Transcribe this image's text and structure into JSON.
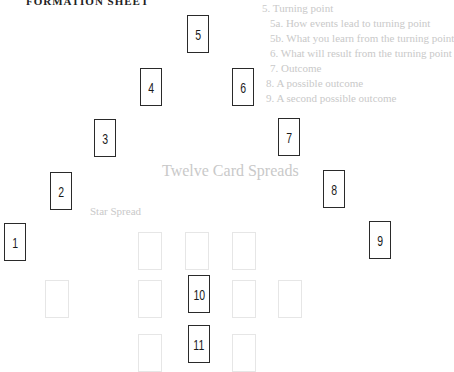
{
  "header": {
    "title": "FORMATION SHEET"
  },
  "background_bleed": {
    "lines": [
      "5. Turning point",
      "5a. How events lead to turning point",
      "5b. What you learn from the turning point",
      "6. What will result from the turning point",
      "7. Outcome",
      "8. A possible outcome",
      "9. A second possible outcome"
    ],
    "heading": "Twelve Card Spreads",
    "subheading": "Star Spread"
  },
  "cards": [
    {
      "label": "1",
      "x": 4,
      "y": 223
    },
    {
      "label": "2",
      "x": 50,
      "y": 172
    },
    {
      "label": "3",
      "x": 94,
      "y": 119
    },
    {
      "label": "4",
      "x": 140,
      "y": 68
    },
    {
      "label": "5",
      "x": 187,
      "y": 15
    },
    {
      "label": "6",
      "x": 232,
      "y": 68
    },
    {
      "label": "7",
      "x": 278,
      "y": 118
    },
    {
      "label": "8",
      "x": 323,
      "y": 170
    },
    {
      "label": "9",
      "x": 369,
      "y": 221
    },
    {
      "label": "10",
      "x": 188,
      "y": 275
    },
    {
      "label": "11",
      "x": 188,
      "y": 325
    }
  ]
}
